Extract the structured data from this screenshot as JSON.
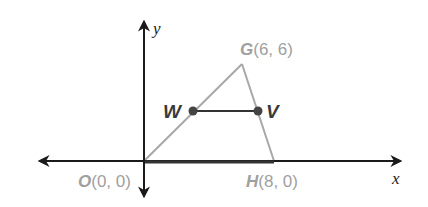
{
  "diagram": {
    "type": "coordinate-plane-triangle",
    "axes": {
      "x_label": "x",
      "y_label": "y"
    },
    "points": {
      "O": {
        "name": "O",
        "coords": "(0, 0)",
        "x": 0,
        "y": 0
      },
      "G": {
        "name": "G",
        "coords": "(6, 6)",
        "x": 6,
        "y": 6
      },
      "H": {
        "name": "H",
        "coords": "(8, 0)",
        "x": 8,
        "y": 0
      },
      "W": {
        "name": "W"
      },
      "V": {
        "name": "V"
      }
    },
    "segments": [
      {
        "from": "O",
        "to": "G"
      },
      {
        "from": "G",
        "to": "H"
      },
      {
        "from": "O",
        "to": "H"
      },
      {
        "from": "W",
        "to": "V"
      }
    ],
    "colors": {
      "axis": "#1a1a1a",
      "triangle": "#a8a8a8",
      "vertex_label": "#a0a0a0",
      "midsegment": "#333333",
      "point_fill": "#444444",
      "point_label": "#3a3a3a"
    }
  }
}
